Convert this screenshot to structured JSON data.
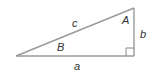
{
  "diagram": {
    "type": "right-triangle",
    "vertices": {
      "left": [
        16,
        56
      ],
      "top_right": [
        134,
        8
      ],
      "bottom_right": [
        134,
        56
      ]
    },
    "right_angle_at": "bottom_right",
    "line_color": "#9a9a9a",
    "label_color": "#333333",
    "labels": {
      "hypotenuse": "c",
      "vertical_side": "b",
      "base": "a",
      "angle_top": "A",
      "angle_left": "B"
    }
  }
}
